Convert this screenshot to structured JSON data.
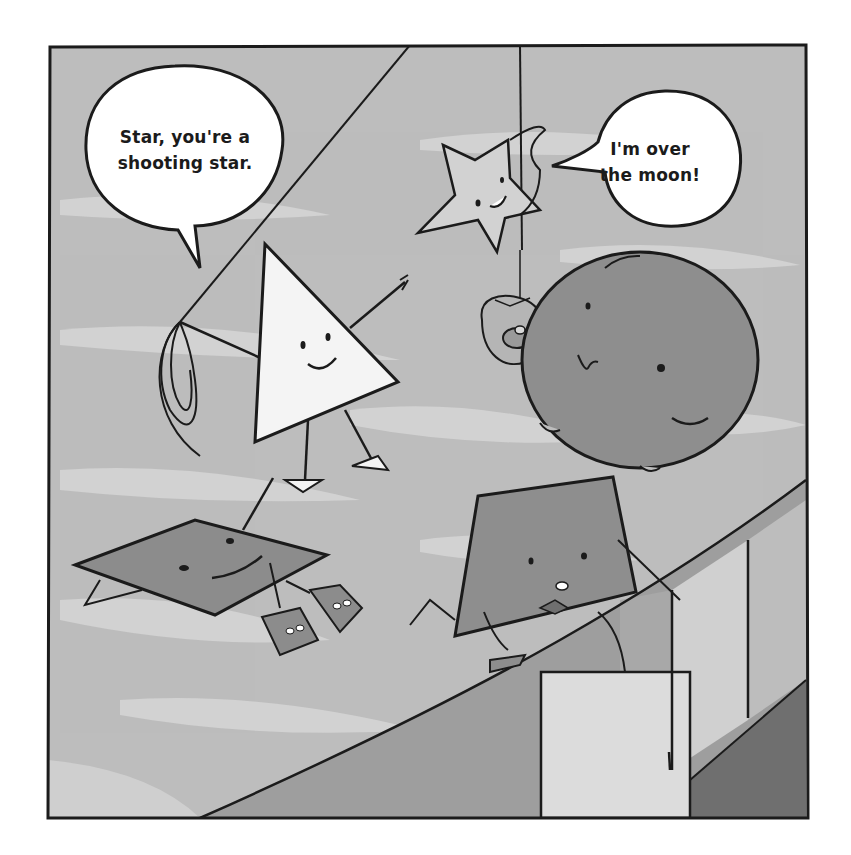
{
  "panel": {
    "background_color": "#bfbfbf",
    "border_color": "#1b1b1b",
    "characters": [
      {
        "name": "triangle",
        "fill": "#f4f4f4",
        "expression": "smiling",
        "holding": "lasso"
      },
      {
        "name": "star",
        "fill": "#d2d2d2",
        "expression": "smiling",
        "attached_to": "rope"
      },
      {
        "name": "circle",
        "fill": "#8e8e8e",
        "expression": "smiling",
        "holding": "donut"
      },
      {
        "name": "rhombus",
        "fill": "#8c8c8c",
        "expression": "smiling",
        "wearing": "shoes"
      },
      {
        "name": "trapezoid",
        "fill": "#8e8e8e",
        "expression": "surprised",
        "wearing": "bow-tie"
      },
      {
        "name": "square-block",
        "fill": "#dcdcdc"
      }
    ]
  },
  "speech_bubbles": [
    {
      "speaker": "triangle",
      "lines": [
        "Star, you're a",
        "shooting star."
      ]
    },
    {
      "speaker": "star",
      "lines": [
        "I'm over",
        "the moon!"
      ]
    }
  ]
}
